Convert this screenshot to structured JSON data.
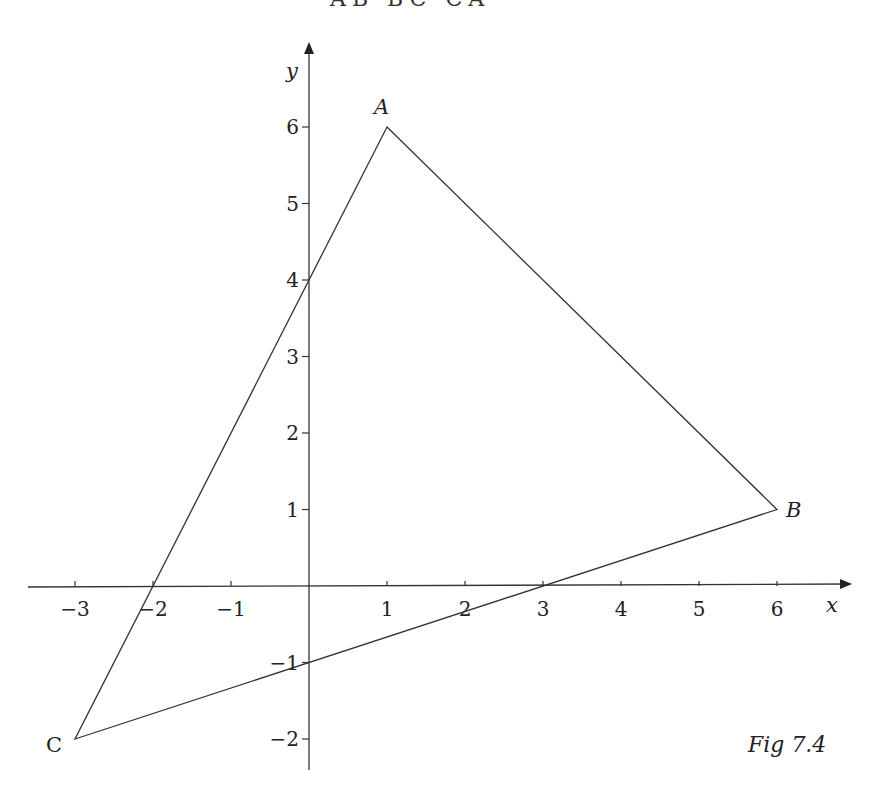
{
  "top_fragment": "AB  BC  CA",
  "axes": {
    "x_label": "x",
    "y_label": "y",
    "x_ticks": [
      {
        "value": -3,
        "label": "−3"
      },
      {
        "value": -2,
        "label": "−2"
      },
      {
        "value": -1,
        "label": "−1"
      },
      {
        "value": 1,
        "label": "1"
      },
      {
        "value": 2,
        "label": "2"
      },
      {
        "value": 3,
        "label": "3"
      },
      {
        "value": 4,
        "label": "4"
      },
      {
        "value": 5,
        "label": "5"
      },
      {
        "value": 6,
        "label": "6"
      }
    ],
    "y_ticks": [
      {
        "value": 6,
        "label": "6"
      },
      {
        "value": 5,
        "label": "5"
      },
      {
        "value": 4,
        "label": "4"
      },
      {
        "value": 3,
        "label": "3"
      },
      {
        "value": 2,
        "label": "2"
      },
      {
        "value": 1,
        "label": "1"
      },
      {
        "value": -1,
        "label": "−1"
      },
      {
        "value": -2,
        "label": "−2"
      }
    ]
  },
  "points": {
    "A": {
      "label": "A",
      "x": 1,
      "y": 6
    },
    "B": {
      "label": "B",
      "x": 6,
      "y": 1
    },
    "C": {
      "label": "C",
      "x": -3,
      "y": -2
    }
  },
  "caption": "Fig 7.4",
  "colors": {
    "line": "#333333",
    "text": "#222222",
    "background": "#ffffff"
  }
}
